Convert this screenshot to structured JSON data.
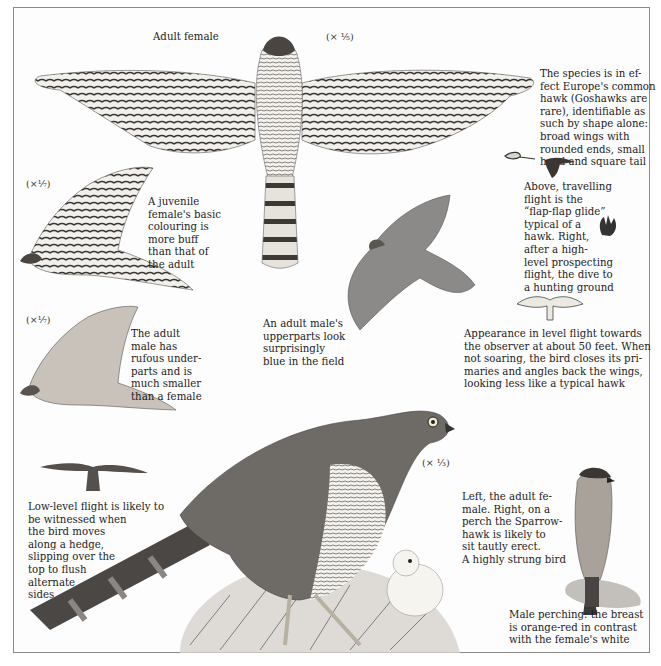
{
  "page": {
    "title_label": "Adult female",
    "scales": {
      "adult_female_flight": "(× ⅕)",
      "juvenile": "(×⅐)",
      "adult_male_flight": "(×⅐)",
      "perched_female": "(× ⅓)"
    },
    "captions": {
      "intro": "The species is in ef-\nfect Europe's common\nhawk (Goshawks are\nrare), identifiable as\nsuch by shape alone:\nbroad wings with\nrounded ends, small\nhead and square tail",
      "juvenile": "A juvenile\nfemale's basic\ncolouring is\nmore buff\nthan that of\nthe adult",
      "flight_patterns": "Above, travelling\nflight is the\n“flap-flap glide”\ntypical of a\nhawk. Right,\nafter a high-\nlevel prospecting\nflight, the dive to\na hunting ground",
      "adult_male": "The adult\nmale has\nrufous under-\nparts and is\nmuch smaller\nthan a female",
      "male_upperparts": "An adult male's\nupperparts look\nsurprisingly\nblue in the field",
      "level_flight": "Appearance in level flight towards\nthe observer at about 50 feet. When\nnot soaring, the bird closes its pri-\nmaries and angles back the wings,\nlooking less like a typical hawk",
      "low_level": "Low-level flight is likely to\nbe witnessed when\nthe bird moves\nalong a hedge,\nslipping over the\ntop to flush\nalternate\nsides",
      "perching": "Left, the adult fe-\nmale. Right, on a\nperch the Sparrow-\nhawk is likely to\nsit tautly erect.\nA highly strung bird",
      "male_perching": "Male perching: the breast\nis orange-red in contrast\nwith the female's white"
    },
    "illustrations": [
      "adult-female-underside-flight",
      "juvenile-female-flight",
      "adult-male-underside-flight",
      "adult-male-upperside-flight",
      "flap-glide-silhouettes",
      "diving-silhouette",
      "head-on-level-flight",
      "low-level-flight-silhouette",
      "perched-adult-female-with-chick",
      "male-perching-on-post"
    ]
  }
}
